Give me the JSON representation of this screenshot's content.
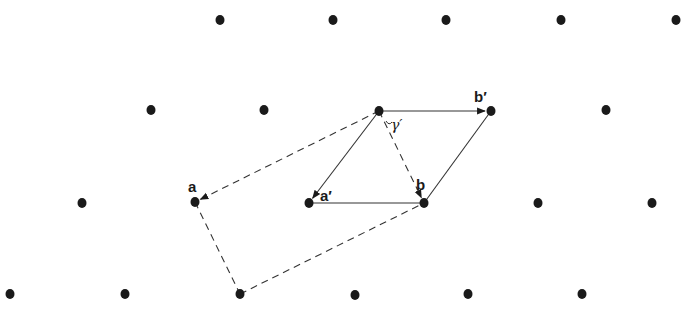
{
  "diagram": {
    "type": "2D lattice with unit cells",
    "colors": {
      "dot": "#1a1a1a",
      "line": "#333333",
      "background": "#ffffff"
    },
    "lattice_points": [
      {
        "x": 220,
        "y": 20
      },
      {
        "x": 333,
        "y": 20
      },
      {
        "x": 446,
        "y": 20
      },
      {
        "x": 561,
        "y": 20
      },
      {
        "x": 676,
        "y": 20
      },
      {
        "x": 151,
        "y": 110
      },
      {
        "x": 264,
        "y": 110
      },
      {
        "x": 379,
        "y": 111
      },
      {
        "x": 491,
        "y": 111
      },
      {
        "x": 606,
        "y": 110
      },
      {
        "x": 82,
        "y": 203
      },
      {
        "x": 195,
        "y": 202
      },
      {
        "x": 309,
        "y": 203
      },
      {
        "x": 424,
        "y": 203
      },
      {
        "x": 538,
        "y": 203
      },
      {
        "x": 652,
        "y": 203
      },
      {
        "x": 10,
        "y": 294
      },
      {
        "x": 125,
        "y": 294
      },
      {
        "x": 240,
        "y": 294
      },
      {
        "x": 355,
        "y": 295
      },
      {
        "x": 468,
        "y": 294
      },
      {
        "x": 582,
        "y": 294
      }
    ],
    "solid_cell": {
      "name": "primitive cell",
      "edges": [
        {
          "from": [
            379,
            111
          ],
          "to": [
            491,
            111
          ],
          "arrow": true,
          "label": "b_prime"
        },
        {
          "from": [
            379,
            111
          ],
          "to": [
            309,
            203
          ],
          "arrow": true,
          "label": "a_prime"
        },
        {
          "from": [
            309,
            203
          ],
          "to": [
            424,
            203
          ],
          "arrow": false
        },
        {
          "from": [
            424,
            203
          ],
          "to": [
            491,
            111
          ],
          "arrow": false
        }
      ]
    },
    "dashed_cell": {
      "name": "centered cell",
      "edges": [
        {
          "from": [
            379,
            111
          ],
          "to": [
            195,
            202
          ],
          "arrow": true,
          "label": "a"
        },
        {
          "from": [
            379,
            111
          ],
          "to": [
            424,
            203
          ],
          "arrow": true,
          "label": "b"
        },
        {
          "from": [
            195,
            202
          ],
          "to": [
            240,
            294
          ],
          "arrow": false
        },
        {
          "from": [
            240,
            294
          ],
          "to": [
            424,
            203
          ],
          "arrow": false
        }
      ]
    },
    "labels": {
      "a": "a",
      "b": "b",
      "a_prime": "a′",
      "b_prime": "b′",
      "gamma_prime": "γ′"
    }
  }
}
